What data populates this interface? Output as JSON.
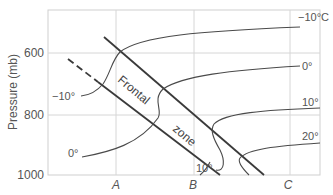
{
  "diagram": {
    "y_axis": {
      "label": "Pressure (mb)",
      "ticks": [
        "600",
        "800",
        "1000"
      ]
    },
    "x_axis": {
      "ticks": [
        "A",
        "B",
        "C"
      ]
    },
    "frontal_zone_label": {
      "word1": "Frontal",
      "word2": "zone"
    },
    "isotherms": [
      {
        "label": "−10°C",
        "side": "right"
      },
      {
        "label": "0°",
        "side": "right"
      },
      {
        "label": "10°",
        "side": "right"
      },
      {
        "label": "20°",
        "side": "right"
      },
      {
        "label": "−10°",
        "side": "left"
      },
      {
        "label": "0°",
        "side": "left"
      },
      {
        "label": "10°",
        "side": "bottom"
      }
    ],
    "colors": {
      "grid": "#d0d0d0",
      "frame": "#c8c8c8",
      "front_line": "#3a3a3a",
      "isotherm": "#4a4a4a",
      "text": "#555555"
    }
  }
}
